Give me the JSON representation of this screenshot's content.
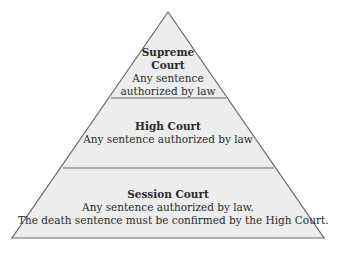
{
  "diagram": {
    "type": "pyramid",
    "colors": {
      "fill": "#ededed",
      "stroke": "#6a6a6a",
      "text": "#2a2a2a"
    },
    "tiers": [
      {
        "title_lines": [
          "Supreme",
          "Court"
        ],
        "description_lines": [
          "Any sentence",
          "authorized by law"
        ]
      },
      {
        "title_lines": [
          "High Court"
        ],
        "description_lines": [
          "Any sentence authorized by law"
        ]
      },
      {
        "title_lines": [
          "Session Court"
        ],
        "description_lines": [
          "Any sentence authorized by law.",
          "The death sentence must be confirmed by the High Court."
        ]
      }
    ]
  }
}
